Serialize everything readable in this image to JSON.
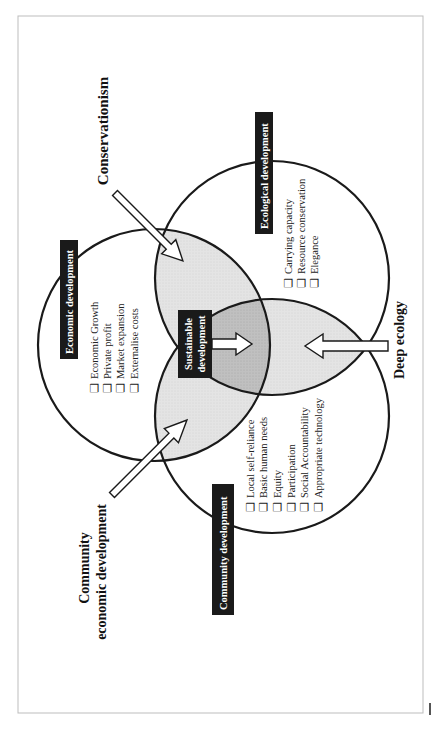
{
  "diagram": {
    "orientation": "rotated -90deg (text reads bottom-to-top)",
    "colors": {
      "background": "#ffffff",
      "frame": "#bdbdbd",
      "circle_stroke": "#1a1a1a",
      "pair_overlap_fill": "#e6e6e6",
      "center_overlap_fill": "#c2c2c2",
      "label_box_fill": "#1a1a1a",
      "label_box_text": "#ffffff",
      "arrow_fill": "#ffffff",
      "arrow_stroke": "#1a1a1a"
    },
    "circles": [
      {
        "id": "economic",
        "title": "Economic development",
        "items": [
          "Economic Growth",
          "Private profit",
          "Market expansion",
          "Externalise costs"
        ]
      },
      {
        "id": "ecological",
        "title": "Ecological development",
        "items": [
          "Carrying capacity",
          "Resource conservation",
          "Elegance"
        ]
      },
      {
        "id": "community",
        "title": "Community development",
        "items": [
          "Local self-reliance",
          "Basic human needs",
          "Equity",
          "Participation",
          "Social Accountability",
          "Appropriate technology"
        ]
      }
    ],
    "center": {
      "line1": "Sustainable",
      "line2": "development"
    },
    "external_labels": {
      "conservationism": "Conservationism",
      "deep_ecology": "Deep ecology",
      "community_economic_line1": "Community",
      "community_economic_line2": "economic development"
    },
    "checkbox_glyph": "❑"
  }
}
